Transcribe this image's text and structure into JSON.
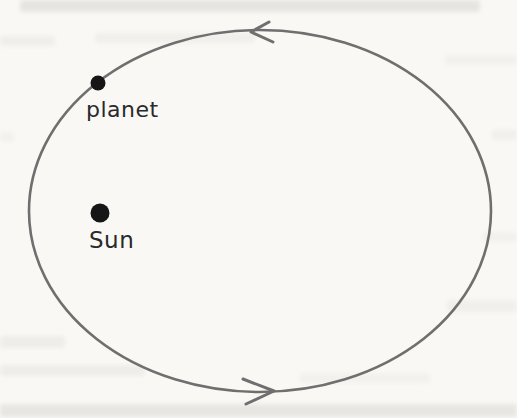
{
  "diagram": {
    "type": "orbit-diagram",
    "labels": {
      "planet": "planet",
      "sun": "Sun"
    },
    "orbit": {
      "shape": "ellipse",
      "cx": 260,
      "cy": 211,
      "rx": 231,
      "ry": 181,
      "direction": "counterclockwise"
    },
    "planet_dot": {
      "x": 98,
      "y": 83,
      "r": 7.5
    },
    "sun_dot": {
      "x": 100,
      "y": 213,
      "r": 9.5
    },
    "arrows": {
      "top": {
        "points": "269,22 251,32 273,42",
        "direction": "left"
      },
      "bottom": {
        "points": "243,379 274,391 246,404",
        "direction": "right"
      }
    }
  },
  "colors": {
    "page_bg": "#f9f8f5",
    "orbit_stroke": "#6f6f6f",
    "ink": "#161616",
    "text": "#2a2a2a"
  }
}
